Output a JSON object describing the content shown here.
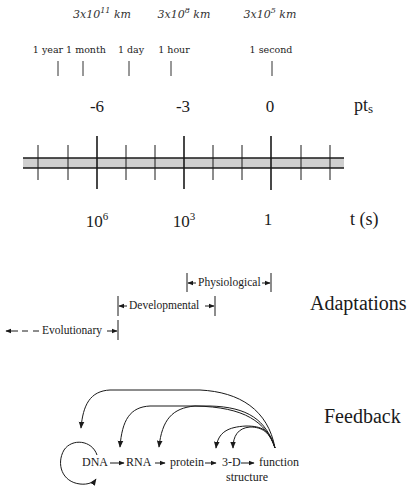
{
  "distances": [
    {
      "base": "3x10",
      "exp": "11",
      "unit": " km",
      "x": 102
    },
    {
      "base": "3x10",
      "exp": "8",
      "unit": " km",
      "x": 184
    },
    {
      "base": "3x10",
      "exp": "5",
      "unit": " km",
      "x": 270
    }
  ],
  "time_markers": [
    {
      "label": "1 year",
      "x": 58
    },
    {
      "label": "1 month",
      "x": 83
    },
    {
      "label": "1 day",
      "x": 129
    },
    {
      "label": "1 hour",
      "x": 171
    },
    {
      "label": "1 second",
      "x": 272
    }
  ],
  "pt_axis": {
    "name": "pt",
    "name_sub": "s",
    "ticks": [
      {
        "label": "-6",
        "x": 97
      },
      {
        "label": "-3",
        "x": 184
      },
      {
        "label": "0",
        "x": 271
      }
    ]
  },
  "t_axis": {
    "name": "t (s)",
    "ticks": [
      {
        "base": "10",
        "exp": "6",
        "x": 97
      },
      {
        "base": "10",
        "exp": "3",
        "x": 184
      },
      {
        "base": "1",
        "exp": "",
        "x": 271
      }
    ]
  },
  "adaptations": {
    "title": "Adaptations",
    "ranges": [
      {
        "label": "Physiological",
        "from_x": 187,
        "to_x": 271
      },
      {
        "label": "Developmental",
        "from_x": 118,
        "to_x": 215
      },
      {
        "label": "Evolutionary",
        "from_x": 5,
        "to_x": 118
      }
    ]
  },
  "feedback": {
    "title": "Feedback",
    "nodes": [
      {
        "label": "DNA"
      },
      {
        "label": "RNA"
      },
      {
        "label": "protein"
      },
      {
        "label": "3-D"
      },
      {
        "label": "structure"
      },
      {
        "label": "function"
      }
    ]
  },
  "colors": {
    "bar_fill": "#cfcfcf",
    "line": "#1a1a1a"
  }
}
